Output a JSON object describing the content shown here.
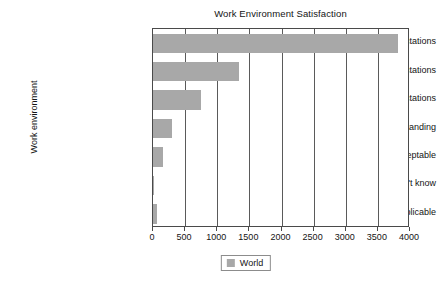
{
  "chart_data": {
    "type": "bar",
    "orientation": "horizontal",
    "title": "Work Environment Satisfaction",
    "xlabel": "",
    "ylabel": "Work environment",
    "categories": [
      "Meeting expectations",
      "Below expectations",
      "Exceeding expectations",
      "Outstanding",
      "Unacceptable",
      "Don't know",
      "N/A - not applicable"
    ],
    "series": [
      {
        "name": "World",
        "color": "#a8a8a8",
        "values": [
          3820,
          1340,
          750,
          290,
          160,
          10,
          55
        ]
      }
    ],
    "xlim": [
      0,
      4000
    ],
    "xticks": [
      0,
      500,
      1000,
      1500,
      2000,
      2500,
      3000,
      3500,
      4000
    ],
    "xtick_labels": [
      "0",
      "500",
      "1000",
      "1500",
      "2000",
      "2500",
      "3000",
      "3500",
      "4000"
    ],
    "grid": "vertical",
    "legend": {
      "position": "bottom",
      "entries": [
        {
          "label": "World",
          "color": "#a8a8a8"
        }
      ]
    }
  }
}
